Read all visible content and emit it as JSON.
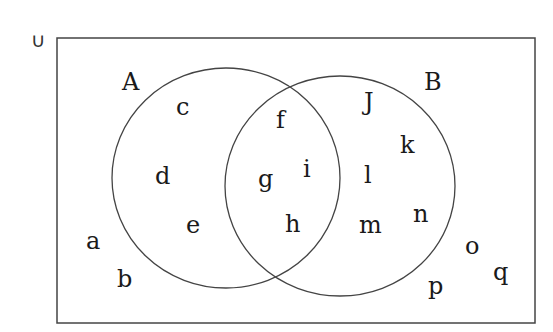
{
  "diagram": {
    "type": "venn",
    "universal_label": "∪",
    "sets": [
      {
        "name": "A",
        "elements_only": [
          "c",
          "d",
          "e"
        ]
      },
      {
        "name": "B",
        "elements_only": [
          "J",
          "k",
          "l",
          "m",
          "n"
        ]
      }
    ],
    "intersection": [
      "f",
      "g",
      "h",
      "i"
    ],
    "outside": [
      "a",
      "b",
      "o",
      "p",
      "q"
    ],
    "labels": {
      "U": "∪",
      "A": "A",
      "B": "B",
      "a": "a",
      "b": "b",
      "c": "c",
      "d": "d",
      "e": "e",
      "f": "f",
      "g": "g",
      "h": "h",
      "i": "i",
      "J": "J",
      "k": "k",
      "l": "l",
      "m": "m",
      "n": "n",
      "o": "o",
      "p": "p",
      "q": "q"
    },
    "colors": {
      "stroke": "#444444",
      "text": "#1a1a1a",
      "background": "#ffffff"
    }
  }
}
